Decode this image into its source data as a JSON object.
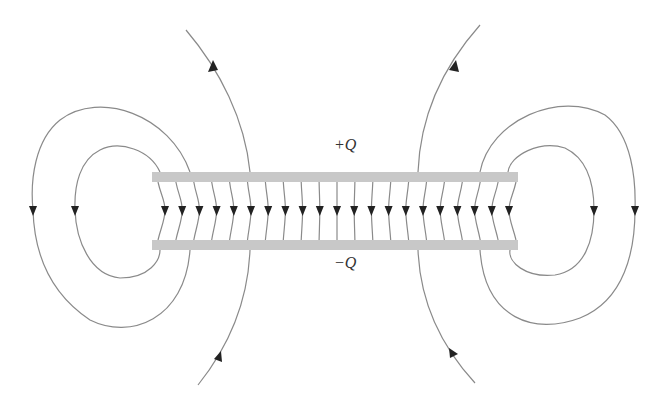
{
  "diagram": {
    "labels": {
      "top_plate": "+Q",
      "bottom_plate": "−Q"
    },
    "colors": {
      "background": "#ffffff",
      "plate_fill": "#c8c8c8",
      "field_line": "#8a8a8a",
      "arrow": "#222222",
      "label": "#333333"
    },
    "plates": {
      "top": {
        "x": 152,
        "y": 172,
        "width": 366,
        "height": 10,
        "charge": "+Q"
      },
      "bottom": {
        "x": 152,
        "y": 240,
        "width": 366,
        "height": 10,
        "charge": "-Q"
      }
    },
    "interior_field_lines": {
      "count": 21,
      "x_start": 152,
      "x_end": 518,
      "arrow_y": 210,
      "direction": "down"
    },
    "fringe_loops": [
      {
        "side": "left",
        "type": "outer",
        "arrow_x": 33,
        "direction": "down"
      },
      {
        "side": "left",
        "type": "inner",
        "arrow_x": 75,
        "direction": "down"
      },
      {
        "side": "right",
        "type": "inner",
        "arrow_x": 594,
        "direction": "down"
      },
      {
        "side": "right",
        "type": "outer",
        "arrow_x": 635,
        "direction": "down"
      }
    ],
    "open_field_lines": [
      {
        "position": "upper-left",
        "direction": "up"
      },
      {
        "position": "upper-right",
        "direction": "up"
      },
      {
        "position": "lower-left",
        "direction": "up"
      },
      {
        "position": "lower-right",
        "direction": "up"
      }
    ]
  }
}
